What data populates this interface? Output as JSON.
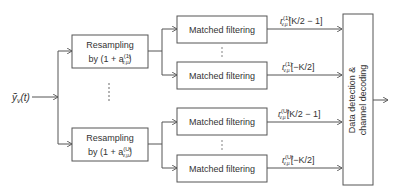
{
  "input": {
    "symbol": "ỹ",
    "subscript": "v",
    "arg": "(t)"
  },
  "resampling": [
    {
      "line1": "Resampling",
      "line2_prefix": "by (1 + a",
      "sup": "(1)",
      "sub": "v,μ",
      "line2_suffix": ")"
    },
    {
      "line1": "Resampling",
      "line2_prefix": "by (1 + a",
      "sup": "(U)",
      "sub": "v,μ",
      "line2_suffix": ")"
    }
  ],
  "matched_filters": [
    {
      "label": "Matched filtering"
    },
    {
      "label": "Matched filtering"
    },
    {
      "label": "Matched filtering"
    },
    {
      "label": "Matched filtering"
    }
  ],
  "outputs": [
    {
      "base": "r",
      "sup": "(1)",
      "sub": "v,μ",
      "index": "[K/2 − 1]"
    },
    {
      "base": "r",
      "sup": "(1)",
      "sub": "v,μ",
      "index": "[−K/2]"
    },
    {
      "base": "r",
      "sup": "(U)",
      "sub": "v,μ",
      "index": "[K/2 − 1]"
    },
    {
      "base": "r",
      "sup": "(U)",
      "sub": "v,μ",
      "index": "[−K/2]"
    }
  ],
  "decoder": {
    "line1": "Data detection &",
    "line2": "channel decoding"
  },
  "colors": {
    "stroke": "#555555",
    "text": "#333333"
  }
}
